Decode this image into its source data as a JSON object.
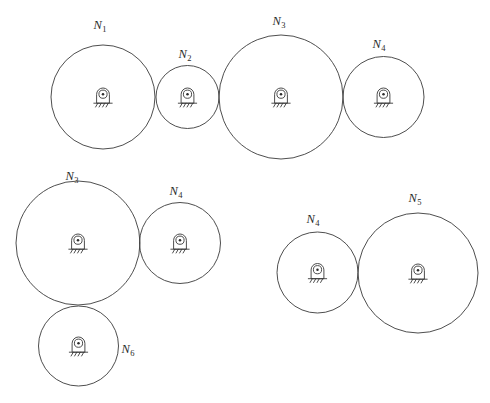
{
  "figure": {
    "background_color": "#ffffff",
    "stroke_color": "#3a3a3a",
    "label_color": "#2b2b2b",
    "width": 490,
    "height": 403
  },
  "support_symbol": {
    "name": "fixed-bearing-support",
    "description": "rounded-top pedestal housing with shaft circle, center dot, ground line and diagonal hatching"
  },
  "groups": [
    {
      "id": "group-top",
      "name": "top-gear-train",
      "gears": [
        {
          "id": "gear-n1",
          "label_letter": "N",
          "label_sub": "1",
          "label_text": "N1",
          "cx": 103,
          "cy": 97,
          "r": 52,
          "label_x": 100,
          "label_y": 29
        },
        {
          "id": "gear-n2",
          "label_letter": "N",
          "label_sub": "2",
          "label_text": "N2",
          "cx": 187.5,
          "cy": 97,
          "r": 31.5,
          "label_x": 185,
          "label_y": 58
        },
        {
          "id": "gear-n3",
          "label_letter": "N",
          "label_sub": "3",
          "label_text": "N3",
          "cx": 281,
          "cy": 97,
          "r": 62,
          "label_x": 279,
          "label_y": 25
        },
        {
          "id": "gear-n4",
          "label_letter": "N",
          "label_sub": "4",
          "label_text": "N4",
          "cx": 383.5,
          "cy": 97,
          "r": 40.5,
          "label_x": 379,
          "label_y": 48
        }
      ]
    },
    {
      "id": "group-left",
      "name": "left-gear-train",
      "gears": [
        {
          "id": "gear-n3-b",
          "label_letter": "N",
          "label_sub": "3",
          "label_text": "N3",
          "cx": 78,
          "cy": 243,
          "r": 62,
          "label_x": 72,
          "label_y": 180
        },
        {
          "id": "gear-n4-b",
          "label_letter": "N",
          "label_sub": "4",
          "label_text": "N4",
          "cx": 180,
          "cy": 243,
          "r": 40.5,
          "label_x": 176,
          "label_y": 195
        },
        {
          "id": "gear-n6",
          "label_letter": "N",
          "label_sub": "6",
          "label_text": "N6",
          "cx": 78.5,
          "cy": 346,
          "r": 40,
          "label_x": 128,
          "label_y": 353
        }
      ]
    },
    {
      "id": "group-right",
      "name": "right-gear-train",
      "gears": [
        {
          "id": "gear-n4-c",
          "label_letter": "N",
          "label_sub": "4",
          "label_text": "N4",
          "cx": 317.5,
          "cy": 272.5,
          "r": 40.5,
          "label_x": 313,
          "label_y": 223
        },
        {
          "id": "gear-n5",
          "label_letter": "N",
          "label_sub": "5",
          "label_text": "N5",
          "cx": 418,
          "cy": 273,
          "r": 60,
          "label_x": 415,
          "label_y": 202
        }
      ]
    }
  ]
}
